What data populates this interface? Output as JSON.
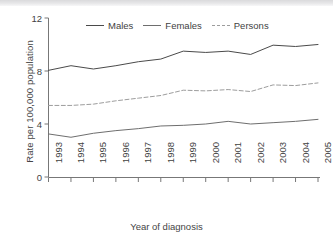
{
  "chart_data": {
    "type": "line",
    "title": "",
    "xlabel": "Year of diagnosis",
    "ylabel": "Rate per 100,000 population",
    "x": [
      1993,
      1994,
      1995,
      1996,
      1997,
      1998,
      1999,
      2000,
      2001,
      2002,
      2003,
      2004,
      2005
    ],
    "xtick_labels": [
      "1993",
      "1994",
      "1995",
      "1996",
      "1997",
      "1998",
      "1999",
      "2000",
      "2001",
      "2002",
      "2003",
      "2004",
      "2005"
    ],
    "ytick_labels": [
      "0",
      "4",
      "8",
      "12"
    ],
    "yticks": [
      0,
      4,
      8,
      12
    ],
    "ylim": [
      0,
      12
    ],
    "grid": false,
    "legend_position": "top-center",
    "series": [
      {
        "name": "Males",
        "style": "solid",
        "color": "#4a4a4a",
        "values": [
          8.05,
          8.4,
          8.15,
          8.4,
          8.7,
          8.9,
          9.5,
          9.4,
          9.5,
          9.25,
          9.95,
          9.85,
          10.0
        ]
      },
      {
        "name": "Females",
        "style": "solid",
        "color": "#6e6e6e",
        "values": [
          3.25,
          3.0,
          3.3,
          3.5,
          3.65,
          3.85,
          3.9,
          4.0,
          4.2,
          4.0,
          4.1,
          4.2,
          4.35
        ]
      },
      {
        "name": "Persons",
        "style": "dashed",
        "color": "#9d9d9d",
        "values": [
          5.4,
          5.4,
          5.5,
          5.75,
          5.95,
          6.15,
          6.55,
          6.5,
          6.6,
          6.45,
          6.95,
          6.9,
          7.1
        ]
      }
    ]
  },
  "legend": {
    "entries": [
      {
        "label": "Males"
      },
      {
        "label": "Females"
      },
      {
        "label": "Persons"
      }
    ]
  },
  "axes": {
    "x_title": "Year of diagnosis",
    "y_title": "Rate per 100,000 population"
  }
}
